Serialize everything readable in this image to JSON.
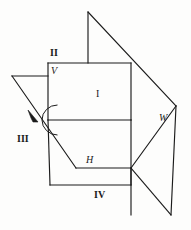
{
  "figure": {
    "stroke_color": "#1b1b1b",
    "background_color": "#fdfdfc",
    "labels": {
      "quadrant_1": "I",
      "quadrant_2": "II",
      "quadrant_3": "III",
      "quadrant_4": "IV",
      "plane_v": "V",
      "plane_h": "H",
      "plane_w": "W"
    },
    "annotations": {
      "rotation_arc": "rotation-arc",
      "rotation_arrow": "rotation-arrow"
    }
  },
  "geometry": {
    "description": "Line drawing of the vertical plane V, horizontal plane H and profile plane W intersecting to form quadrants I-IV.",
    "vertices": {
      "top_apex": [
        88,
        12
      ],
      "v_top_right": [
        131,
        63
      ],
      "v_top_left": [
        48,
        63
      ],
      "left_tip": [
        12,
        76
      ],
      "center_cross": [
        48,
        120
      ],
      "v_bottom_right": [
        131,
        120
      ],
      "h_front": [
        76,
        168
      ],
      "h_right": [
        131,
        168
      ],
      "bottom_left": [
        50,
        185
      ],
      "right_upper": [
        176,
        106
      ],
      "right_lower": [
        171,
        215
      ],
      "w_mid": [
        161,
        155
      ]
    },
    "segments": [
      "top vertical apex to V top edge",
      "apex diagonal to right-upper",
      "V plane rectangle",
      "H plane parallelogram",
      "W plane quadrilateral",
      "left quadrant III triangle"
    ]
  }
}
